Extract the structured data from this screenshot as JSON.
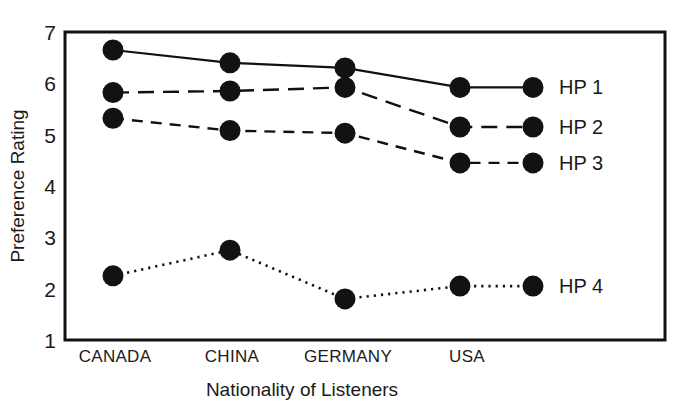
{
  "chart_data": {
    "type": "line",
    "title": "",
    "xlabel": "Nationality of Listeners",
    "ylabel": "Preference Rating",
    "categories": [
      "CANADA",
      "CHINA",
      "GERMANY",
      "USA"
    ],
    "ylim": [
      1,
      7
    ],
    "yticks": [
      1,
      2,
      3,
      4,
      5,
      6,
      7
    ],
    "ytick_labels": [
      "1",
      "2",
      "3",
      "4",
      "5",
      "6",
      "7"
    ],
    "grid": false,
    "legend_position": "right-inline-at-last-point",
    "series": [
      {
        "name": "HP 1",
        "values": [
          6.65,
          6.4,
          6.3,
          5.92
        ],
        "linestyle": "solid",
        "marker": "filled-circle",
        "color": "#111111"
      },
      {
        "name": "HP 2",
        "values": [
          5.82,
          5.85,
          5.92,
          5.15
        ],
        "linestyle": "long-dashed",
        "marker": "filled-circle",
        "color": "#111111"
      },
      {
        "name": "HP 3",
        "values": [
          5.32,
          5.08,
          5.03,
          4.45
        ],
        "linestyle": "dashed",
        "marker": "filled-circle",
        "color": "#111111"
      },
      {
        "name": "HP 4",
        "values": [
          2.25,
          2.75,
          1.8,
          2.05
        ],
        "linestyle": "dotted",
        "marker": "filled-circle",
        "color": "#111111"
      }
    ]
  },
  "figure": {
    "background_color": "#ffffff",
    "frame_color": "#111111",
    "text_color": "#1a1a1a"
  }
}
